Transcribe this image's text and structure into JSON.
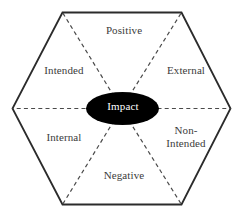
{
  "diagram": {
    "shape": "hexagon",
    "background_color": "#ffffff",
    "outline_color": "#2b2b2b",
    "divider_color": "#4a4a4a",
    "divider_style": "dashed",
    "label_color": "#3b3b3b",
    "center": {
      "shape": "ellipse",
      "label": "Impact",
      "fill_color": "#000000",
      "text_color": "#ffffff"
    },
    "sectors": [
      {
        "id": "positive",
        "label": "Positive",
        "position": "top"
      },
      {
        "id": "external",
        "label": "External",
        "position": "upper-right"
      },
      {
        "id": "non-intended",
        "label": "Non-\nIntended",
        "position": "lower-right"
      },
      {
        "id": "negative",
        "label": "Negative",
        "position": "bottom"
      },
      {
        "id": "internal",
        "label": "Internal",
        "position": "lower-left"
      },
      {
        "id": "intended",
        "label": "Intended",
        "position": "upper-left"
      }
    ]
  }
}
